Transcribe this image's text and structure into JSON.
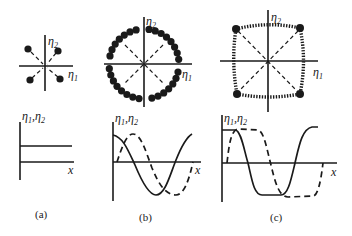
{
  "figure": {
    "panels": [
      {
        "id": "a",
        "caption": "(a)",
        "phase_plane": {
          "x_axis_label": "η",
          "x_axis_sub": "1",
          "y_axis_label": "η",
          "y_axis_sub": "2",
          "description": "Four isolated dots in the four quadrants with dashed arrows pointing toward the origin"
        },
        "profile": {
          "y_label": "η",
          "y_label_sub1": "1",
          "y_label_sep": ",η",
          "y_label_sub2": "2",
          "x_label": "x",
          "description": "Constant (flat) profile"
        }
      },
      {
        "id": "b",
        "caption": "(b)",
        "phase_plane": {
          "x_axis_label": "η",
          "x_axis_sub": "1",
          "y_axis_label": "η",
          "y_axis_sub": "2",
          "description": "Circle of densely packed dots, dashed diagonals through origin"
        },
        "profile": {
          "y_label": "η",
          "y_label_sub1": "1",
          "y_label_sep": ",η",
          "y_label_sub2": "2",
          "x_label": "x",
          "description": "Sinusoidal profiles: solid cosine-like, dashed sine-like (phase shifted)"
        }
      },
      {
        "id": "c",
        "caption": "(c)",
        "phase_plane": {
          "x_axis_label": "η",
          "x_axis_sub": "1",
          "y_axis_label": "η",
          "y_axis_sub": "2",
          "description": "Rounded square of dense dots with four large corner dots, dashed diagonals through origin"
        },
        "profile": {
          "y_label": "η",
          "y_label_sub1": "1",
          "y_label_sep": ",η",
          "y_label_sub2": "2",
          "x_label": "x",
          "description": "Square-wave-like profiles: solid and dashed with flattened plateaus"
        }
      }
    ]
  }
}
